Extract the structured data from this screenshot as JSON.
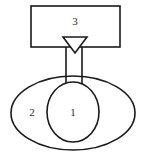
{
  "diagram": {
    "background_color": "#ffffff",
    "stroke_color": "#1a1a1a",
    "label_color": "#2b2b2b",
    "parts": {
      "inner_circle": {
        "label": "1",
        "shape": "circle",
        "cx": 73,
        "cy": 112,
        "rx": 26,
        "ry": 30,
        "label_x": 73,
        "label_y": 113
      },
      "outer_ellipse": {
        "label": "2",
        "shape": "ellipse",
        "cx": 73,
        "cy": 113,
        "rx": 62,
        "ry": 37,
        "label_x": 32,
        "label_y": 113
      },
      "top_rectangle": {
        "label": "3",
        "shape": "rectangle",
        "x": 31,
        "y": 6,
        "width": 89,
        "height": 41,
        "label_x": 75,
        "label_y": 22
      },
      "neck": {
        "shape": "connector",
        "left_x": 66,
        "right_x": 82,
        "top_y": 47,
        "bottom_y": 84
      },
      "valve_triangle": {
        "shape": "triangle-down",
        "apex_x": 75,
        "apex_y": 53,
        "left_x": 63,
        "right_x": 87,
        "top_y": 37
      }
    }
  }
}
